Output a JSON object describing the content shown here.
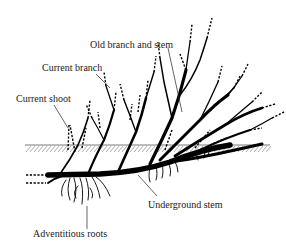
{
  "figure": {
    "labels": {
      "old_branch": "Old branch and stem",
      "current_branch": "Current branch",
      "current_shoot": "Current shoot",
      "underground_stem": "Underground stem",
      "adventitious_roots": "Adventitious roots"
    },
    "colors": {
      "ink": "#000000",
      "ground_hatch": "#777777",
      "background": "#ffffff"
    }
  }
}
